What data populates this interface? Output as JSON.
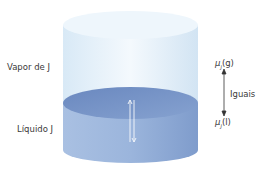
{
  "labels": {
    "vapor": "Vapor de J",
    "liquid": "Líquido J",
    "mu_gas_symbol": "μ",
    "mu_gas_sub": "J",
    "mu_gas_phase": "(g)",
    "mu_liq_symbol": "μ",
    "mu_liq_sub": "J",
    "mu_liq_phase": "(l)",
    "equal": "Iguais"
  },
  "colors": {
    "vapor_top": "#eaf4fb",
    "vapor_body": "#dbeaf6",
    "liquid_surface": "#6f8fc4",
    "liquid_body": "#93afd8",
    "text": "#3a3a3a"
  }
}
